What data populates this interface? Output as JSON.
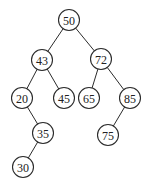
{
  "diagram": {
    "type": "binary-search-tree",
    "node_radius": 10.5,
    "colors": {
      "stroke": "#2b2b2b",
      "fill": "#ffffff",
      "text": "#222222",
      "background": "#ffffff"
    },
    "nodes": [
      {
        "id": "n50",
        "label": "50",
        "x": 69,
        "y": 20
      },
      {
        "id": "n43",
        "label": "43",
        "x": 42,
        "y": 60
      },
      {
        "id": "n72",
        "label": "72",
        "x": 101,
        "y": 59
      },
      {
        "id": "n20",
        "label": "20",
        "x": 22,
        "y": 98
      },
      {
        "id": "n45",
        "label": "45",
        "x": 64,
        "y": 98
      },
      {
        "id": "n65",
        "label": "65",
        "x": 89,
        "y": 98
      },
      {
        "id": "n85",
        "label": "85",
        "x": 130,
        "y": 98
      },
      {
        "id": "n35",
        "label": "35",
        "x": 43,
        "y": 133
      },
      {
        "id": "n75",
        "label": "75",
        "x": 108,
        "y": 135
      },
      {
        "id": "n30",
        "label": "30",
        "x": 23,
        "y": 167
      }
    ],
    "edges": [
      {
        "from": "n50",
        "to": "n43"
      },
      {
        "from": "n50",
        "to": "n72"
      },
      {
        "from": "n43",
        "to": "n20"
      },
      {
        "from": "n43",
        "to": "n45"
      },
      {
        "from": "n72",
        "to": "n65"
      },
      {
        "from": "n72",
        "to": "n85"
      },
      {
        "from": "n20",
        "to": "n35"
      },
      {
        "from": "n35",
        "to": "n30"
      },
      {
        "from": "n85",
        "to": "n75"
      }
    ]
  }
}
